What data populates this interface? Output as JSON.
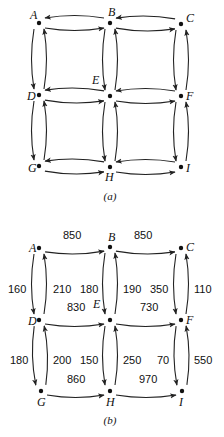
{
  "panels": [
    {
      "caption": "(a)",
      "nodes": [
        {
          "id": "A",
          "label": "A",
          "x": 39,
          "y": 23,
          "lx": 30,
          "ly": 19
        },
        {
          "id": "B",
          "label": "B",
          "x": 110,
          "y": 23,
          "lx": 108,
          "ly": 16
        },
        {
          "id": "C",
          "label": "C",
          "x": 181,
          "y": 24,
          "lx": 186,
          "ly": 22
        },
        {
          "id": "D",
          "label": "D",
          "x": 39,
          "y": 95,
          "lx": 27,
          "ly": 100
        },
        {
          "id": "E",
          "label": "E",
          "x": 110,
          "y": 96,
          "lx": 92,
          "ly": 84
        },
        {
          "id": "F",
          "label": "F",
          "x": 181,
          "y": 96,
          "lx": 186,
          "ly": 100
        },
        {
          "id": "G",
          "label": "G",
          "x": 39,
          "y": 166,
          "lx": 28,
          "ly": 172
        },
        {
          "id": "H",
          "label": "H",
          "x": 110,
          "y": 167,
          "lx": 105,
          "ly": 181
        },
        {
          "id": "I",
          "label": "I",
          "x": 181,
          "y": 167,
          "lx": 186,
          "ly": 172
        }
      ],
      "edges": [
        {
          "from": "A",
          "to": "B"
        },
        {
          "from": "B",
          "to": "A"
        },
        {
          "from": "B",
          "to": "C"
        },
        {
          "from": "C",
          "to": "B"
        },
        {
          "from": "D",
          "to": "E"
        },
        {
          "from": "E",
          "to": "D"
        },
        {
          "from": "E",
          "to": "F"
        },
        {
          "from": "F",
          "to": "E"
        },
        {
          "from": "G",
          "to": "H"
        },
        {
          "from": "H",
          "to": "G"
        },
        {
          "from": "H",
          "to": "I"
        },
        {
          "from": "I",
          "to": "H"
        },
        {
          "from": "A",
          "to": "D"
        },
        {
          "from": "D",
          "to": "A"
        },
        {
          "from": "B",
          "to": "E"
        },
        {
          "from": "E",
          "to": "B"
        },
        {
          "from": "C",
          "to": "F"
        },
        {
          "from": "F",
          "to": "C"
        },
        {
          "from": "D",
          "to": "G"
        },
        {
          "from": "G",
          "to": "D"
        },
        {
          "from": "E",
          "to": "H"
        },
        {
          "from": "H",
          "to": "E"
        },
        {
          "from": "F",
          "to": "I"
        },
        {
          "from": "I",
          "to": "F"
        }
      ],
      "caption_x": 110,
      "caption_y": 200
    },
    {
      "caption": "(b)",
      "nodes": [
        {
          "id": "A",
          "label": "A",
          "x": 39,
          "y": 248,
          "lx": 29,
          "ly": 252
        },
        {
          "id": "B",
          "label": "B",
          "x": 110,
          "y": 247,
          "lx": 108,
          "ly": 241
        },
        {
          "id": "C",
          "label": "C",
          "x": 181,
          "y": 248,
          "lx": 186,
          "ly": 251
        },
        {
          "id": "D",
          "label": "D",
          "x": 39,
          "y": 320,
          "lx": 28,
          "ly": 325
        },
        {
          "id": "E",
          "label": "E",
          "x": 110,
          "y": 320,
          "lx": 93,
          "ly": 308
        },
        {
          "id": "F",
          "label": "F",
          "x": 181,
          "y": 320,
          "lx": 186,
          "ly": 324
        },
        {
          "id": "G",
          "label": "G",
          "x": 41,
          "y": 391,
          "lx": 37,
          "ly": 406
        },
        {
          "id": "H",
          "label": "H",
          "x": 110,
          "y": 391,
          "lx": 106,
          "ly": 406
        },
        {
          "id": "I",
          "label": "I",
          "x": 182,
          "y": 391,
          "lx": 179,
          "ly": 406
        }
      ],
      "edges": [
        {
          "from": "A",
          "to": "B",
          "label": "850",
          "lx": 63,
          "ly": 235
        },
        {
          "from": "B",
          "to": "C",
          "label": "850",
          "lx": 134,
          "ly": 235
        },
        {
          "from": "D",
          "to": "E",
          "label": "830",
          "lx": 67,
          "ly": 307
        },
        {
          "from": "E",
          "to": "F",
          "label": "730",
          "lx": 140,
          "ly": 307
        },
        {
          "from": "G",
          "to": "H",
          "label": "860",
          "lx": 67,
          "ly": 379
        },
        {
          "from": "H",
          "to": "I",
          "label": "970",
          "lx": 139,
          "ly": 379
        },
        {
          "from": "D",
          "to": "A",
          "label": "160",
          "lx": 8,
          "ly": 289
        },
        {
          "from": "A",
          "to": "D",
          "label": "210",
          "lx": 53,
          "ly": 289
        },
        {
          "from": "E",
          "to": "B",
          "label": "180",
          "lx": 80,
          "ly": 289
        },
        {
          "from": "B",
          "to": "E",
          "label": "190",
          "lx": 123,
          "ly": 289
        },
        {
          "from": "F",
          "to": "C",
          "label": "350",
          "lx": 150,
          "ly": 289
        },
        {
          "from": "C",
          "to": "F",
          "label": "110",
          "lx": 194,
          "ly": 289
        },
        {
          "from": "G",
          "to": "D",
          "label": "180",
          "lx": 10,
          "ly": 360
        },
        {
          "from": "D",
          "to": "G",
          "label": "200",
          "lx": 53,
          "ly": 360
        },
        {
          "from": "H",
          "to": "E",
          "label": "150",
          "lx": 80,
          "ly": 360
        },
        {
          "from": "E",
          "to": "H",
          "label": "250",
          "lx": 123,
          "ly": 360
        },
        {
          "from": "I",
          "to": "F",
          "label": "70",
          "lx": 157,
          "ly": 360
        },
        {
          "from": "F",
          "to": "I",
          "label": "550",
          "lx": 194,
          "ly": 360
        }
      ],
      "caption_x": 110,
      "caption_y": 424
    }
  ]
}
